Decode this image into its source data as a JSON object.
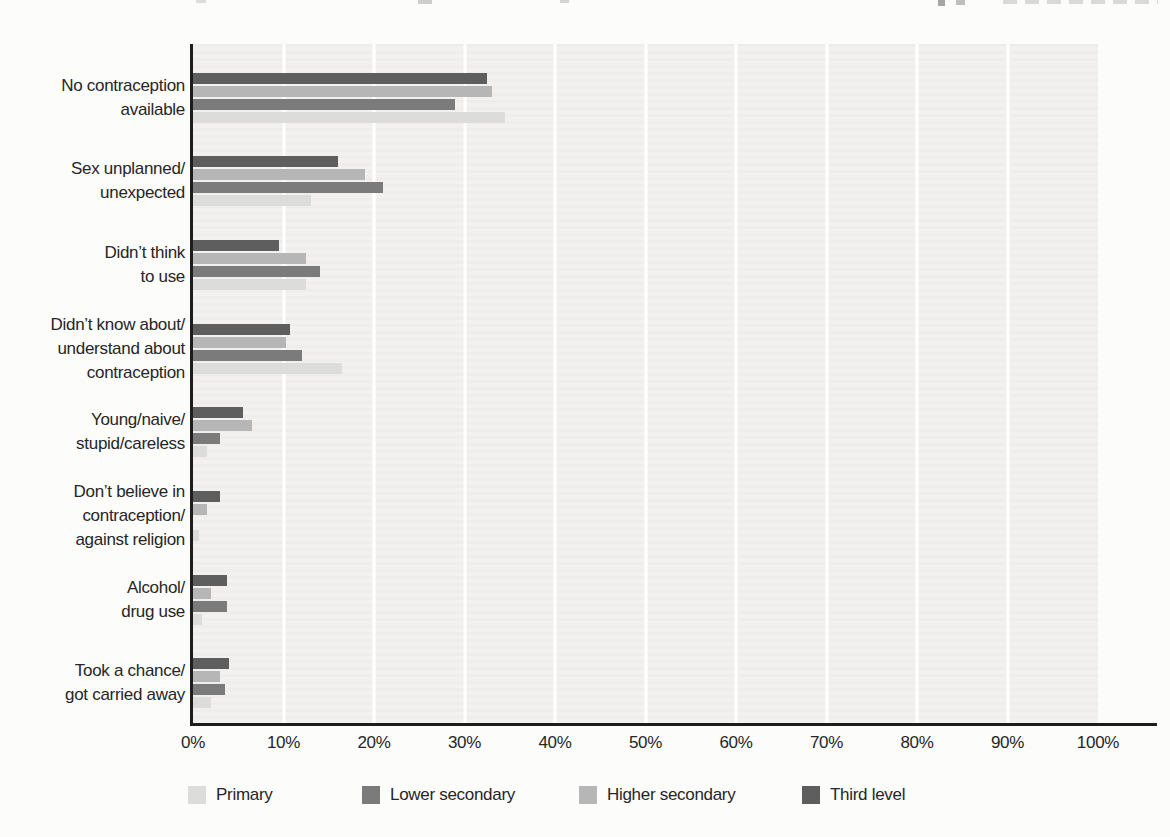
{
  "chart_data": {
    "type": "bar",
    "orientation": "horizontal",
    "unit": "%",
    "categories": [
      "No contraception available",
      "Sex unplanned/unexpected",
      "Didn’t think to use",
      "Didn’t know about/understand about contraception",
      "Young/naive/stupid/careless",
      "Don’t believe in contraception/against religion",
      "Alcohol/drug use",
      "Took a chance/got carried away"
    ],
    "category_label_lines": [
      [
        "No contraception",
        "available"
      ],
      [
        "Sex unplanned/",
        "unexpected"
      ],
      [
        "Didn’t think",
        "to use"
      ],
      [
        "Didn’t know about/",
        "understand about",
        "contraception"
      ],
      [
        "Young/naive/",
        "stupid/careless"
      ],
      [
        "Don’t believe in",
        "contraception/",
        "against religion"
      ],
      [
        "Alcohol/",
        "drug use"
      ],
      [
        "Took a chance/",
        "got carried away"
      ]
    ],
    "series": [
      {
        "name": "Primary",
        "color": "#dcdcda",
        "values": [
          34.5,
          13,
          12.5,
          16.5,
          1.5,
          0.7,
          1,
          2
        ]
      },
      {
        "name": "Lower secondary",
        "color": "#7b7b7b",
        "values": [
          29,
          21,
          14,
          12,
          3,
          0,
          3.8,
          3.5
        ]
      },
      {
        "name": "Higher secondary",
        "color": "#b6b6b6",
        "values": [
          33,
          19,
          12.5,
          10.3,
          6.5,
          1.5,
          2,
          3
        ]
      },
      {
        "name": "Third level",
        "color": "#5e5e5e",
        "values": [
          32.5,
          16,
          9.5,
          10.7,
          5.5,
          3,
          3.8,
          4
        ]
      }
    ],
    "bar_order_top_to_bottom": [
      "Third level",
      "Higher secondary",
      "Lower secondary",
      "Primary"
    ],
    "x_axis": {
      "min": 0,
      "max": 100,
      "tick_step": 10,
      "tick_labels": [
        "0%",
        "10%",
        "20%",
        "30%",
        "40%",
        "50%",
        "60%",
        "70%",
        "80%",
        "90%",
        "100%"
      ]
    },
    "grid": {
      "vertical_gridlines": true,
      "color": "#ffffff"
    },
    "plot_background": "#f2f1ef",
    "axis_color": "#1d1d1b",
    "text_color": "#262626",
    "legend": {
      "position": "bottom",
      "items": [
        {
          "label": "Primary",
          "color": "#dcdcda"
        },
        {
          "label": "Lower secondary",
          "color": "#7b7b7b"
        },
        {
          "label": "Higher secondary",
          "color": "#b6b6b6"
        },
        {
          "label": "Third level",
          "color": "#5e5e5e"
        }
      ]
    }
  }
}
